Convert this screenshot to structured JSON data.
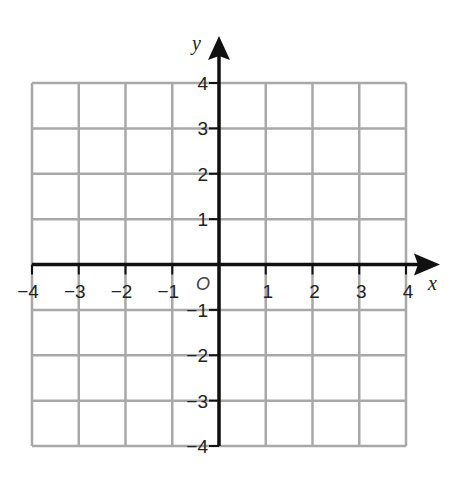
{
  "chart_data": {
    "type": "scatter",
    "title": "",
    "xlabel": "x",
    "ylabel": "y",
    "origin_label": "O",
    "xlim": [
      -4,
      4
    ],
    "ylim": [
      -4,
      4
    ],
    "grid": true,
    "x_ticks": [
      -4,
      -3,
      -2,
      -1,
      1,
      2,
      3,
      4
    ],
    "x_tick_labels": [
      "−4",
      "−3",
      "−2",
      "−1",
      "1",
      "2",
      "3",
      "4"
    ],
    "y_ticks": [
      4,
      3,
      2,
      1,
      -1,
      -2,
      -3,
      -4
    ],
    "y_tick_labels": [
      "4",
      "3",
      "2",
      "1",
      "−1",
      "−2",
      "−3",
      "−4"
    ],
    "series": []
  },
  "colors": {
    "grid": "#a8a8a8",
    "axis": "#111111",
    "text": "#222222"
  }
}
